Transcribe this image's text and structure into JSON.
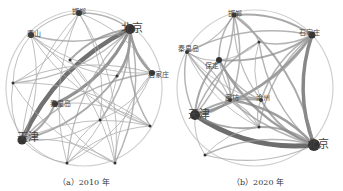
{
  "panels": [
    {
      "id": "a",
      "caption": "（a）2010 年",
      "center": [
        84,
        88
      ],
      "radius": 78,
      "nodes": [
        {
          "name": "邯郸",
          "x": 79,
          "y": 13,
          "label": true,
          "size": 6,
          "lx": 72,
          "ly": 14
        },
        {
          "name": "唐山",
          "x": 31,
          "y": 35,
          "label": true,
          "size": 6,
          "lx": 27,
          "ly": 36
        },
        {
          "name": "北京",
          "x": 130,
          "y": 29,
          "label": true,
          "size": 10,
          "lx": 121,
          "ly": 32
        },
        {
          "name": "石家庄",
          "x": 152,
          "y": 73,
          "label": true,
          "size": 6,
          "lx": 148,
          "ly": 77
        },
        {
          "name": "",
          "x": 13,
          "y": 83,
          "label": false,
          "size": 3
        },
        {
          "name": "秦皇岛",
          "x": 55,
          "y": 104,
          "label": true,
          "size": 6,
          "lx": 50,
          "ly": 106
        },
        {
          "name": "天津",
          "x": 22,
          "y": 140,
          "label": true,
          "size": 9,
          "lx": 17,
          "ly": 141
        },
        {
          "name": "",
          "x": 70,
          "y": 60,
          "label": false,
          "size": 3
        },
        {
          "name": "",
          "x": 117,
          "y": 76,
          "label": false,
          "size": 3
        },
        {
          "name": "",
          "x": 100,
          "y": 120,
          "label": false,
          "size": 3
        },
        {
          "name": "",
          "x": 150,
          "y": 126,
          "label": false,
          "size": 3
        },
        {
          "name": "",
          "x": 115,
          "y": 163,
          "label": false,
          "size": 3
        },
        {
          "name": "",
          "x": 67,
          "y": 163,
          "label": false,
          "size": 3
        }
      ],
      "edges": [
        [
          2,
          6,
          4.5
        ],
        [
          2,
          5,
          3
        ],
        [
          2,
          3,
          2.5
        ],
        [
          2,
          8,
          2.5
        ],
        [
          2,
          0,
          1.5
        ],
        [
          2,
          1,
          1.5
        ],
        [
          2,
          7,
          2
        ],
        [
          2,
          9,
          1.5
        ],
        [
          2,
          10,
          1.5
        ],
        [
          2,
          11,
          1.5
        ],
        [
          2,
          12,
          1.2
        ],
        [
          2,
          4,
          1.2
        ],
        [
          6,
          5,
          2
        ],
        [
          6,
          3,
          1.5
        ],
        [
          6,
          8,
          2
        ],
        [
          6,
          0,
          1
        ],
        [
          6,
          1,
          1
        ],
        [
          6,
          4,
          1
        ],
        [
          6,
          12,
          1
        ],
        [
          6,
          11,
          1
        ],
        [
          6,
          9,
          1
        ],
        [
          6,
          10,
          1
        ],
        [
          3,
          0,
          1
        ],
        [
          3,
          1,
          1
        ],
        [
          3,
          4,
          1.2
        ],
        [
          3,
          12,
          1
        ],
        [
          3,
          11,
          1
        ],
        [
          3,
          9,
          1
        ],
        [
          0,
          1,
          1.2
        ],
        [
          0,
          4,
          1
        ],
        [
          0,
          12,
          1
        ],
        [
          0,
          11,
          1
        ],
        [
          1,
          4,
          1
        ],
        [
          1,
          11,
          1
        ],
        [
          1,
          10,
          1
        ],
        [
          4,
          10,
          1
        ],
        [
          4,
          11,
          1
        ],
        [
          12,
          10,
          1
        ],
        [
          7,
          10,
          1
        ],
        [
          5,
          10,
          1
        ],
        [
          9,
          12,
          1
        ],
        [
          8,
          12,
          1
        ],
        [
          5,
          11,
          1
        ],
        [
          7,
          11,
          1
        ],
        [
          1,
          8,
          1
        ],
        [
          0,
          9,
          1
        ]
      ]
    },
    {
      "id": "b",
      "caption": "（b）2020 年",
      "center": [
        255,
        88
      ],
      "radius": 78,
      "nodes": [
        {
          "name": "邯郸",
          "x": 234,
          "y": 15,
          "label": true,
          "size": 5,
          "lx": 228,
          "ly": 16
        },
        {
          "name": "石家庄",
          "x": 312,
          "y": 35,
          "label": true,
          "size": 7,
          "lx": 299,
          "ly": 35
        },
        {
          "name": "",
          "x": 259,
          "y": 42,
          "label": false,
          "size": 3
        },
        {
          "name": "秦皇岛",
          "x": 187,
          "y": 52,
          "label": true,
          "size": 4,
          "lx": 178,
          "ly": 51
        },
        {
          "name": "保定",
          "x": 219,
          "y": 60,
          "label": true,
          "size": 6,
          "lx": 205,
          "ly": 68
        },
        {
          "name": "廊坊",
          "x": 230,
          "y": 100,
          "label": true,
          "size": 4,
          "lx": 225,
          "ly": 100
        },
        {
          "name": "沧州",
          "x": 261,
          "y": 100,
          "label": true,
          "size": 4,
          "lx": 256,
          "ly": 100
        },
        {
          "name": "天津",
          "x": 195,
          "y": 115,
          "label": true,
          "size": 10,
          "lx": 188,
          "ly": 118
        },
        {
          "name": "",
          "x": 259,
          "y": 127,
          "label": false,
          "size": 3
        },
        {
          "name": "北京",
          "x": 314,
          "y": 145,
          "label": true,
          "size": 12,
          "lx": 307,
          "ly": 148
        },
        {
          "name": "",
          "x": 205,
          "y": 155,
          "label": false,
          "size": 3
        }
      ],
      "edges": [
        [
          7,
          9,
          5
        ],
        [
          9,
          1,
          3.5
        ],
        [
          7,
          1,
          2.5
        ],
        [
          9,
          4,
          2.5
        ],
        [
          9,
          5,
          2.5
        ],
        [
          9,
          6,
          2
        ],
        [
          9,
          0,
          2
        ],
        [
          9,
          3,
          1.5
        ],
        [
          9,
          8,
          2
        ],
        [
          9,
          2,
          1.5
        ],
        [
          9,
          10,
          1.5
        ],
        [
          7,
          4,
          2
        ],
        [
          7,
          5,
          2
        ],
        [
          7,
          6,
          2
        ],
        [
          7,
          0,
          1.5
        ],
        [
          7,
          3,
          1.5
        ],
        [
          7,
          8,
          2
        ],
        [
          7,
          2,
          1.5
        ],
        [
          1,
          0,
          2
        ],
        [
          1,
          4,
          2
        ],
        [
          1,
          3,
          1.5
        ],
        [
          1,
          5,
          1.5
        ],
        [
          1,
          6,
          1.5
        ],
        [
          1,
          2,
          1.5
        ],
        [
          1,
          8,
          1.5
        ],
        [
          0,
          3,
          1.2
        ],
        [
          0,
          4,
          1.5
        ],
        [
          0,
          5,
          1.5
        ],
        [
          0,
          6,
          1.2
        ],
        [
          0,
          2,
          1.2
        ],
        [
          3,
          4,
          1.2
        ],
        [
          3,
          5,
          1.2
        ],
        [
          3,
          6,
          1
        ],
        [
          4,
          5,
          1.5
        ],
        [
          4,
          6,
          1.5
        ],
        [
          5,
          6,
          1.5
        ],
        [
          4,
          8,
          1.2
        ],
        [
          5,
          8,
          1.2
        ],
        [
          6,
          8,
          1.2
        ],
        [
          10,
          8,
          1
        ],
        [
          10,
          9,
          1.2
        ],
        [
          10,
          7,
          1
        ],
        [
          3,
          8,
          1
        ],
        [
          2,
          4,
          1
        ],
        [
          2,
          6,
          1
        ]
      ]
    }
  ]
}
